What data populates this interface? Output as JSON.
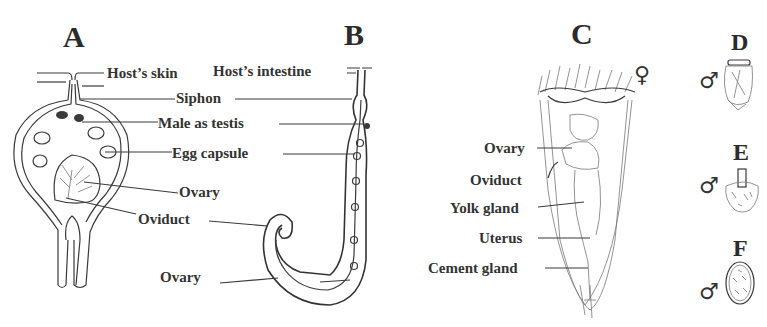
{
  "figure": {
    "panels": [
      {
        "id": "A",
        "letter": "A"
      },
      {
        "id": "B",
        "letter": "B"
      },
      {
        "id": "C",
        "letter": "C"
      },
      {
        "id": "D",
        "letter": "D"
      },
      {
        "id": "E",
        "letter": "E"
      },
      {
        "id": "F",
        "letter": "F"
      }
    ],
    "labels_ab": {
      "host_skin": "Host’s skin",
      "host_intestine": "Host’s intestine",
      "siphon": "Siphon",
      "male_as_testis": "Male as testis",
      "egg_capsule": "Egg capsule",
      "ovary_a": "Ovary",
      "oviduct": "Oviduct",
      "ovary_b": "Ovary"
    },
    "labels_c": {
      "ovary": "Ovary",
      "oviduct": "Oviduct",
      "yolk_gland": "Yolk gland",
      "uterus": "Uterus",
      "cement_gland": "Cement gland"
    },
    "symbols": {
      "female": "♀",
      "male_d": "♂",
      "male_e": "♂",
      "male_f": "♂"
    }
  }
}
